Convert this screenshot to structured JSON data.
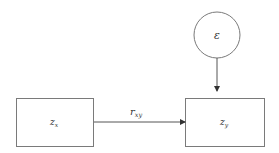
{
  "diagram": {
    "nodes": {
      "error": {
        "label": "ε",
        "shape": "circle"
      },
      "zx": {
        "base": "z",
        "sub": "x",
        "shape": "rectangle"
      },
      "zy": {
        "base": "z",
        "sub": "y",
        "shape": "rectangle"
      }
    },
    "edges": {
      "zx_to_zy": {
        "base": "r",
        "sub": "xy"
      },
      "error_to_zy": {
        "label": ""
      }
    },
    "colors": {
      "stroke": "#7a7a7a",
      "arrow": "#333333",
      "text": "#333333",
      "background": "#ffffff"
    }
  }
}
